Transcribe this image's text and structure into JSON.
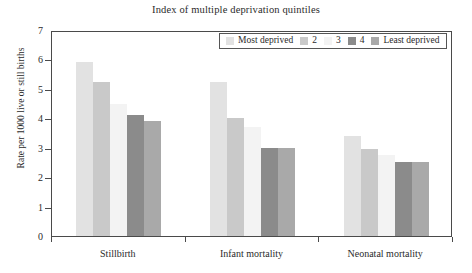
{
  "chart_data": {
    "type": "bar",
    "title": "Index of multiple deprivation quintiles",
    "xlabel": "",
    "ylabel": "Rate per 1000 live or still births",
    "categories": [
      "Stillbirth",
      "Infant mortality",
      "Neonatal mortality"
    ],
    "ylim": [
      0,
      7
    ],
    "yticks": [
      "0",
      "1",
      "2",
      "3",
      "4",
      "5",
      "6",
      "7"
    ],
    "grid": false,
    "legend_position": "top-right",
    "series": [
      {
        "name": "Most deprived",
        "color": "#e2e2e2",
        "values": [
          5.9,
          5.25,
          3.4
        ]
      },
      {
        "name": "2",
        "color": "#c9c9c9",
        "values": [
          5.25,
          4.0,
          2.95
        ]
      },
      {
        "name": "3",
        "color": "#f3f3f3",
        "values": [
          4.5,
          3.7,
          2.75
        ]
      },
      {
        "name": "4",
        "color": "#8b8b8b",
        "values": [
          4.1,
          3.0,
          2.5
        ]
      },
      {
        "name": "Least deprived",
        "color": "#a9a9a9",
        "values": [
          3.9,
          3.0,
          2.5
        ]
      }
    ]
  }
}
